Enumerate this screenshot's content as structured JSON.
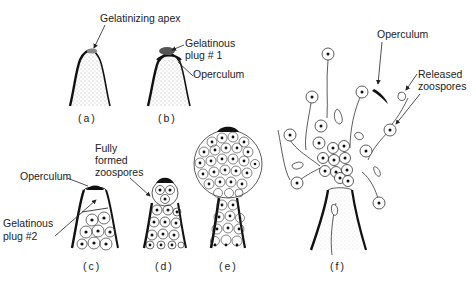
{
  "diagram": {
    "panels": [
      {
        "id": "a",
        "caption": "(a)"
      },
      {
        "id": "b",
        "caption": "(b)"
      },
      {
        "id": "c",
        "caption": "(c)"
      },
      {
        "id": "d",
        "caption": "(d)"
      },
      {
        "id": "e",
        "caption": "(e)"
      },
      {
        "id": "f",
        "caption": "(f)"
      }
    ],
    "labels": {
      "gelatinizing_apex": "Gelatinizing apex",
      "gelatinous_plug_1_line1": "Gelatinous",
      "gelatinous_plug_1_line2": "plug # 1",
      "operculum_b": "Operculum",
      "operculum_c": "Operculum",
      "gelatinous_plug_2_line1": "Gelatinous",
      "gelatinous_plug_2_line2": "plug #2",
      "fully_formed_line1": "Fully",
      "fully_formed_line2": "formed",
      "fully_formed_line3": "zoospores",
      "operculum_f": "Operculum",
      "released_line1": "Released",
      "released_line2": "zoospores"
    }
  }
}
